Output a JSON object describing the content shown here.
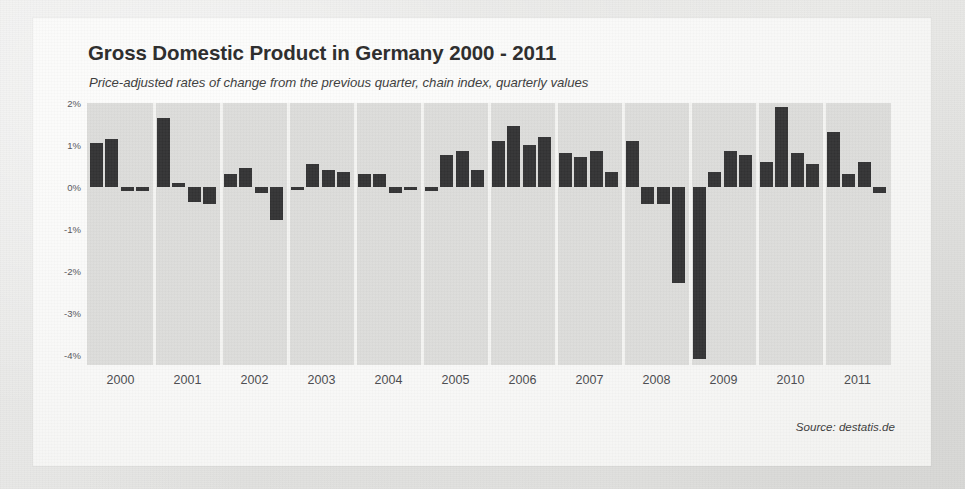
{
  "chart_data": {
    "type": "bar",
    "title": "Gross Domestic Product in Germany 2000 - 2011",
    "subtitle": "Price-adjusted rates of change from the previous quarter, chain index, quarterly values",
    "source": "Source: destatis.de",
    "xlabel": "",
    "ylabel": "",
    "ylim": [
      -4.25,
      2.0
    ],
    "grid": false,
    "legend": "none",
    "ytick_labels": [
      "2%",
      "1%",
      "0%",
      "-1%",
      "-2%",
      "-3%",
      "-4%"
    ],
    "ytick_values": [
      2,
      1,
      0,
      -1,
      -2,
      -3,
      -4
    ],
    "categories": [
      "2000",
      "2001",
      "2002",
      "2003",
      "2004",
      "2005",
      "2006",
      "2007",
      "2008",
      "2009",
      "2010",
      "2011"
    ],
    "quarters": [
      "Q1",
      "Q2",
      "Q3",
      "Q4"
    ],
    "bar_color": "#333334",
    "plot_bg_color": "#dcdcda",
    "card_bg_color": "#f8f8f7",
    "values": [
      {
        "year": "2000",
        "q": [
          1.05,
          1.15,
          -0.1,
          -0.1
        ]
      },
      {
        "year": "2001",
        "q": [
          1.65,
          0.1,
          -0.35,
          -0.4
        ]
      },
      {
        "year": "2002",
        "q": [
          0.3,
          0.45,
          -0.15,
          -0.8
        ]
      },
      {
        "year": "2003",
        "q": [
          -0.05,
          0.55,
          0.4,
          0.35
        ]
      },
      {
        "year": "2004",
        "q": [
          0.3,
          0.3,
          -0.15,
          -0.05
        ]
      },
      {
        "year": "2005",
        "q": [
          -0.1,
          0.75,
          0.85,
          0.4
        ]
      },
      {
        "year": "2006",
        "q": [
          1.1,
          1.45,
          1.0,
          1.2
        ]
      },
      {
        "year": "2007",
        "q": [
          0.8,
          0.7,
          0.85,
          0.35
        ]
      },
      {
        "year": "2008",
        "q": [
          1.1,
          -0.4,
          -0.4,
          -2.3
        ]
      },
      {
        "year": "2009",
        "q": [
          -4.1,
          0.35,
          0.85,
          0.75
        ]
      },
      {
        "year": "2010",
        "q": [
          0.6,
          1.9,
          0.8,
          0.55
        ]
      },
      {
        "year": "2011",
        "q": [
          1.3,
          0.3,
          0.6,
          -0.15
        ]
      }
    ]
  }
}
